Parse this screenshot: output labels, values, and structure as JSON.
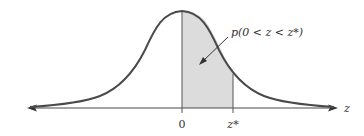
{
  "diagram": {
    "axis_label": "z",
    "ticks": [
      {
        "label": "0",
        "x": 182
      },
      {
        "label": "z*",
        "x": 233
      }
    ],
    "annotation": "p(0 < z < z*)",
    "colors": {
      "curve": "#4a4a4a",
      "shade": "#dcdcdc",
      "axis": "#4a4a4a"
    }
  }
}
